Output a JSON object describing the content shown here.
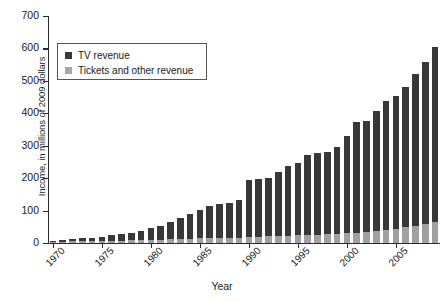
{
  "chart_data": {
    "type": "bar",
    "stacked": true,
    "title": "",
    "xlabel": "Year",
    "ylabel": "Income, in millions of 2009 dollars",
    "ylim": [
      0,
      700
    ],
    "yticks": [
      0,
      100,
      200,
      300,
      400,
      500,
      600,
      700
    ],
    "xticks": [
      1970,
      1975,
      1980,
      1985,
      1990,
      1995,
      2000,
      2005
    ],
    "xlim": [
      1969.5,
      2009.5
    ],
    "grid": false,
    "legend_position": "upper left",
    "categories": [
      1970,
      1971,
      1972,
      1973,
      1974,
      1975,
      1976,
      1977,
      1978,
      1979,
      1980,
      1981,
      1982,
      1983,
      1984,
      1985,
      1986,
      1987,
      1988,
      1989,
      1990,
      1991,
      1992,
      1993,
      1994,
      1995,
      1996,
      1997,
      1998,
      1999,
      2000,
      2001,
      2002,
      2003,
      2004,
      2005,
      2006,
      2007,
      2008,
      2009
    ],
    "series": [
      {
        "name": "TV revenue",
        "color": "#383838",
        "values": [
          3,
          5,
          7,
          9,
          11,
          14,
          17,
          20,
          24,
          29,
          36,
          44,
          53,
          66,
          78,
          88,
          100,
          104,
          108,
          115,
          175,
          178,
          180,
          198,
          215,
          222,
          246,
          252,
          255,
          268,
          300,
          340,
          342,
          370,
          398,
          410,
          432,
          468,
          500,
          540
        ],
        "label": "TV revenue"
      },
      {
        "name": "Tickets and other revenue",
        "color": "#a0a0a0",
        "values": [
          4,
          4,
          5,
          5,
          6,
          6,
          7,
          7,
          8,
          8,
          9,
          10,
          11,
          12,
          13,
          14,
          15,
          16,
          16,
          17,
          20,
          20,
          21,
          22,
          23,
          24,
          25,
          26,
          27,
          28,
          30,
          32,
          34,
          36,
          40,
          44,
          48,
          52,
          58,
          65
        ],
        "label": "Tickets and other revenue"
      }
    ],
    "totals": [
      7,
      9,
      12,
      14,
      17,
      20,
      24,
      27,
      32,
      37,
      45,
      54,
      64,
      78,
      91,
      102,
      115,
      120,
      124,
      132,
      195,
      198,
      201,
      220,
      238,
      246,
      271,
      278,
      282,
      296,
      330,
      372,
      376,
      406,
      438,
      454,
      480,
      520,
      558,
      605
    ]
  },
  "legend": {
    "items": [
      {
        "label": "TV revenue",
        "swatch": "dark"
      },
      {
        "label": "Tickets and other revenue",
        "swatch": "light"
      }
    ]
  },
  "axes": {
    "y_title": "Income, in millions of 2009 dollars",
    "x_title": "Year",
    "y_tick_labels": [
      "0",
      "100",
      "200",
      "300",
      "400",
      "500",
      "600",
      "700"
    ],
    "x_tick_labels": [
      "1970",
      "1975",
      "1980",
      "1985",
      "1990",
      "1995",
      "2000",
      "2005"
    ]
  }
}
